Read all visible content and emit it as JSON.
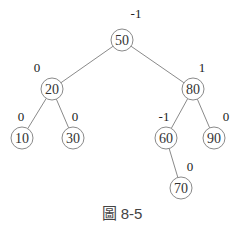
{
  "caption": "圖 8-5",
  "tree": {
    "type": "AVL tree with balance factors",
    "nodes": [
      {
        "id": "n50",
        "value": "50",
        "bf": "-1",
        "x": 122,
        "y": 40,
        "bfx": 136,
        "bfy": 18
      },
      {
        "id": "n20",
        "value": "20",
        "bf": "0",
        "x": 52,
        "y": 89,
        "bfx": 37,
        "bfy": 72
      },
      {
        "id": "n80",
        "value": "80",
        "bf": "1",
        "x": 193,
        "y": 89,
        "bfx": 202,
        "bfy": 72
      },
      {
        "id": "n10",
        "value": "10",
        "bf": "0",
        "x": 22,
        "y": 138,
        "bfx": 21,
        "bfy": 121
      },
      {
        "id": "n30",
        "value": "30",
        "bf": "0",
        "x": 73,
        "y": 138,
        "bfx": 75,
        "bfy": 121
      },
      {
        "id": "n60",
        "value": "60",
        "bf": "-1",
        "x": 166,
        "y": 138,
        "bfx": 164,
        "bfy": 121
      },
      {
        "id": "n90",
        "value": "90",
        "bf": "0",
        "x": 214,
        "y": 138,
        "bfx": 226,
        "bfy": 121
      },
      {
        "id": "n70",
        "value": "70",
        "bf": "0",
        "x": 181,
        "y": 188,
        "bfx": 190,
        "bfy": 171
      }
    ],
    "edges": [
      [
        "n50",
        "n20"
      ],
      [
        "n50",
        "n80"
      ],
      [
        "n20",
        "n10"
      ],
      [
        "n20",
        "n30"
      ],
      [
        "n80",
        "n60"
      ],
      [
        "n80",
        "n90"
      ],
      [
        "n60",
        "n70"
      ]
    ]
  }
}
